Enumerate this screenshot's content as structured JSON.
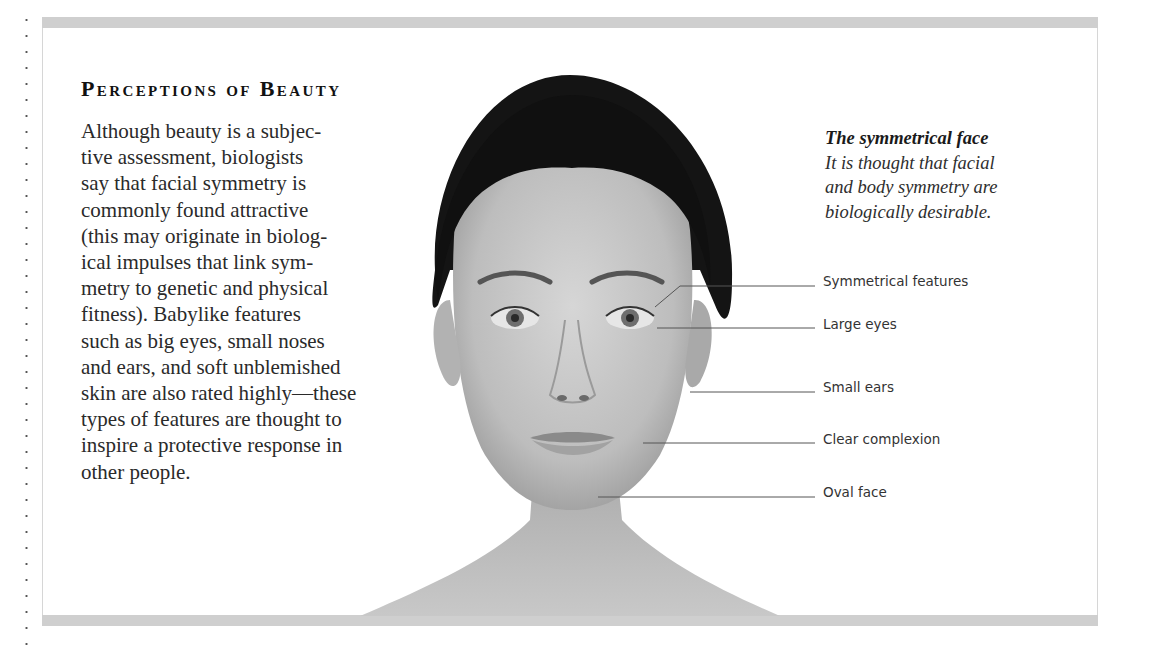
{
  "section": {
    "title": "Perceptions of Beauty",
    "body_lines": [
      "Although beauty is a subjec-",
      "tive assessment, biologists",
      "say that facial symmetry is",
      "commonly found attractive",
      "(this may originate in biolog-",
      "ical impulses that link sym-",
      "metry to genetic and physical",
      "fitness). Babylike features",
      "such as big eyes, small noses",
      "and ears, and soft unblemished",
      "skin are also rated highly—these",
      "types of features are thought to",
      "inspire a protective response in",
      "other people."
    ]
  },
  "caption": {
    "title": "The symmetrical face",
    "lines": [
      "It is thought that facial",
      "and body symmetry are",
      "biologically desirable."
    ]
  },
  "labels": [
    "Symmetrical features",
    "Large eyes",
    "Small ears",
    "Clear complexion",
    "Oval face"
  ],
  "image": {
    "subject": "woman-face-portrait",
    "tone": "grayscale"
  },
  "colors": {
    "frame_bar": "#cfcfcf",
    "text": "#2a2a2a",
    "leader_line": "#555555"
  }
}
